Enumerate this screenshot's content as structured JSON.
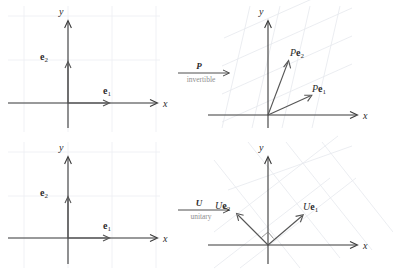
{
  "figure": {
    "background": "#ffffff",
    "axis_color": "#3a3a3a",
    "vector_color": "#555555",
    "grid_color": "#eceef2",
    "label_color": "#2b2b2b",
    "sublabel_color": "#8e8e8e"
  },
  "panels": [
    {
      "id": "top-left",
      "role": "source-basis-for-P",
      "axis_x_label": "x",
      "axis_y_label": "y",
      "grid": "square",
      "vectors": [
        {
          "name": "e1",
          "label_main": "e",
          "label_sub": "1",
          "style": "bold-upright",
          "dx": 1,
          "dy": 0
        },
        {
          "name": "e2",
          "label_main": "e",
          "label_sub": "2",
          "style": "bold-upright",
          "dx": 0,
          "dy": 1
        }
      ]
    },
    {
      "id": "top-right",
      "role": "image-under-P",
      "axis_x_label": "x",
      "axis_y_label": "y",
      "grid": "sheared",
      "vectors": [
        {
          "name": "Pe1",
          "label_prefix": "P",
          "label_main": "e",
          "label_sub": "1",
          "style": "italic-prefix-bold-vector",
          "dx": 0.95,
          "dy": 0.42
        },
        {
          "name": "Pe2",
          "label_prefix": "P",
          "label_main": "e",
          "label_sub": "2",
          "style": "italic-prefix-bold-vector",
          "dx": 0.3,
          "dy": 1.02
        }
      ]
    },
    {
      "id": "bottom-left",
      "role": "source-basis-for-U",
      "axis_x_label": "x",
      "axis_y_label": "y",
      "grid": "square",
      "vectors": [
        {
          "name": "e1",
          "label_main": "e",
          "label_sub": "1",
          "style": "bold-upright",
          "dx": 1,
          "dy": 0
        },
        {
          "name": "e2",
          "label_main": "e",
          "label_sub": "2",
          "style": "bold-upright",
          "dx": 0,
          "dy": 1
        }
      ]
    },
    {
      "id": "bottom-right",
      "role": "image-under-U",
      "axis_x_label": "x",
      "axis_y_label": "y",
      "grid": "rotated",
      "right_angle_marker": true,
      "vectors": [
        {
          "name": "Ue1",
          "label_prefix": "U",
          "label_main": "e",
          "label_sub": "1",
          "style": "italic-prefix-bold-vector",
          "dx": 0.78,
          "dy": 0.62
        },
        {
          "name": "Ue2",
          "label_prefix": "U",
          "label_main": "e",
          "label_sub": "2",
          "style": "italic-prefix-bold-vector",
          "dx": -0.62,
          "dy": 0.78
        }
      ]
    }
  ],
  "maps": [
    {
      "id": "map-P",
      "symbol": "P",
      "caption": "invertible",
      "from": "top-left",
      "to": "top-right"
    },
    {
      "id": "map-U",
      "symbol": "U",
      "caption": "unitary",
      "from": "bottom-left",
      "to": "bottom-right"
    }
  ]
}
